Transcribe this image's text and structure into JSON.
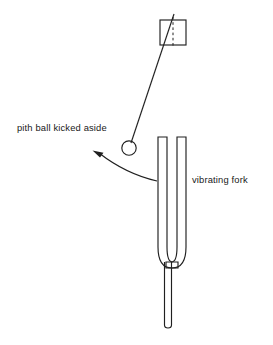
{
  "figure": {
    "background_color": "#ffffff",
    "ink_color": "#202020",
    "width": 273,
    "height": 345
  },
  "labels": {
    "pith_ball": "pith ball kicked aside",
    "vibrating_fork": "vibrating fork"
  },
  "elements": {
    "support_block": {
      "name": "support-block",
      "shape": "square",
      "x": 160,
      "y": 20,
      "width": 26,
      "height": 25,
      "has_dashed_center_line": true
    },
    "string": {
      "name": "suspension-string",
      "from_x": 173,
      "from_y": 18,
      "to_x": 131,
      "to_y": 142
    },
    "pith_ball": {
      "name": "pith-ball",
      "shape": "circle",
      "cx": 129,
      "cy": 148,
      "r": 7.2
    },
    "motion_arrow": {
      "name": "motion-arrow",
      "description": "curved arrow indicating the ball swinging away to the left",
      "tip_x": 93,
      "tip_y": 151,
      "tail_x": 157,
      "tail_y": 181
    },
    "tuning_fork": {
      "name": "tuning-fork",
      "tine_top_y": 137,
      "tine_left_outer_x": 158,
      "tine_left_inner_x": 167,
      "tine_right_inner_x": 177,
      "tine_right_outer_x": 186,
      "bend_bottom_y": 268,
      "handle_left_x": 164,
      "handle_right_x": 172,
      "handle_bottom_y": 328
    }
  }
}
